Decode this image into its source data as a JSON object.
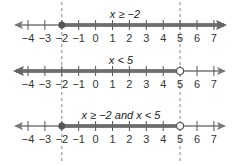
{
  "diagram": {
    "type": "number-lines",
    "tick_values": [
      -4,
      -3,
      -2,
      -1,
      0,
      1,
      2,
      3,
      4,
      5,
      6,
      7
    ],
    "tick_labels": [
      "−4",
      "−3",
      "−2",
      "−1",
      "0",
      "1",
      "2",
      "3",
      "4",
      "5",
      "6",
      "7"
    ],
    "guides": [
      -2,
      5
    ],
    "colors": {
      "axis": "#777777",
      "shade": "#666666",
      "guide": "#888888",
      "text": "#333333"
    },
    "lines": [
      {
        "title": "x ≥ −2",
        "shade_from": -2,
        "shade_to": "right-arrow",
        "left_endpoint": "closed",
        "right_endpoint": null
      },
      {
        "title": "x < 5",
        "shade_from": "left-arrow",
        "shade_to": 5,
        "left_endpoint": null,
        "right_endpoint": "open"
      },
      {
        "title": "x ≥ −2 and x < 5",
        "shade_from": -2,
        "shade_to": 5,
        "left_endpoint": "closed",
        "right_endpoint": "open"
      }
    ]
  }
}
